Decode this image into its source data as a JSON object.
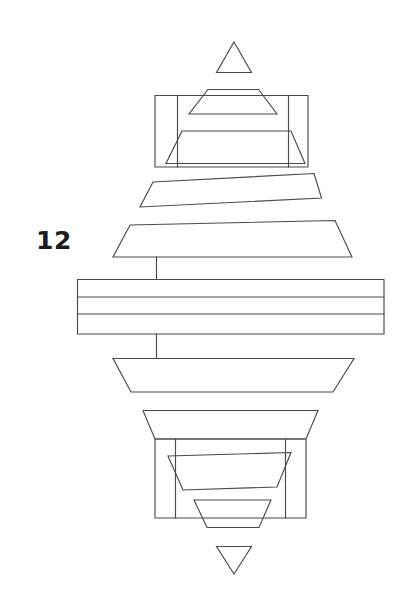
{
  "figure": {
    "reference_label": "12",
    "line_color": "#4a4a4a",
    "background_color": "#ffffff",
    "canvas": {
      "width": 409,
      "height": 602
    },
    "type": "patent-line-drawing",
    "elements": {
      "top_marker_triangle": {
        "name": "up-triangle",
        "points": "234,42 251,72 217,72 234,42"
      },
      "top_assembly_frame": {
        "name": "upper-outer-frame",
        "outline": "155,95 308,95 308,167 155,167",
        "inner_vertical_left": "177,95 177,167",
        "inner_vertical_right": "289,95 289,167"
      },
      "top_small_trapezoid": {
        "name": "upper-inner-small-trapezoid",
        "points": "208,89 258,89 277,114 189,114 208,89"
      },
      "top_large_trapezoid": {
        "name": "upper-inner-large-trapezoid",
        "points": "182,131 291,131 305,163 166,163 182,131"
      },
      "slanted_band": {
        "name": "slanted-band",
        "points": "153,182 314,173 321,198 140,207 153,182"
      },
      "wide_band": {
        "name": "wide-upper-band",
        "points": "130,225 335,220 352,257 113,257 130,257"
      },
      "connector_upper": {
        "name": "upper-connector-line",
        "points": "156,257 156,279"
      },
      "central_block": {
        "name": "central-layer-stack",
        "outline": "77,279 384,279 384,334 77,334",
        "divider_1": "77,297 384,297",
        "divider_2": "77,314 384,314",
        "layer_count": 3
      },
      "connector_lower": {
        "name": "lower-connector-line",
        "points": "156,334 156,358"
      },
      "lower_trapezoid": {
        "name": "lower-trapezoid",
        "points": "113,358 354,358 333,392 131,392 113,358"
      },
      "bottom_assembly_cap": {
        "name": "bottom-cap-trapezoid",
        "points": "143,410 318,410 306,439 155,439 143,410"
      },
      "bottom_assembly_frame": {
        "name": "bottom-outer-frame",
        "outline": "155,439 306,439 306,518 155,518",
        "inner_vertical_left": "175,439 175,518",
        "inner_vertical_right": "286,439 286,518"
      },
      "bottom_inner_large_trapezoid": {
        "name": "bottom-inner-large-trapezoid",
        "points": "168,456 290,453 277,487 183,490 168,456"
      },
      "bottom_inner_small_trapezoid": {
        "name": "bottom-inner-small-trapezoid",
        "points": "194,500 271,500 259,527 207,527 194,500"
      },
      "bottom_marker_triangle": {
        "name": "down-triangle",
        "points": "217,546 251,546 234,574 217,546"
      }
    }
  }
}
